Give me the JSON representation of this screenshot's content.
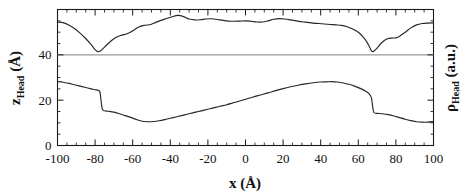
{
  "chart_data": {
    "type": "line",
    "title": "",
    "subtitle": "",
    "xlabel": "x (Å)",
    "ylabel": "z",
    "ylabel_sub": "Head",
    "ylabel_unit": " (Å)",
    "y2label": "ρ",
    "y2label_sub": "Head",
    "y2label_unit": " (a.u.)",
    "xlim": [
      -100,
      100
    ],
    "ylim": [
      0,
      60
    ],
    "xticks": [
      -100,
      -80,
      -60,
      -40,
      -20,
      0,
      20,
      40,
      60,
      80,
      100
    ],
    "xticklabels": [
      "-100",
      "-80",
      "-60",
      "-40",
      "-20",
      "0",
      "20",
      "40",
      "60",
      "80",
      "100"
    ],
    "yticks": [
      0,
      20,
      40
    ],
    "yticklabels": [
      "0",
      "20",
      "40"
    ],
    "xtick_minor_step": 5,
    "ytick_minor_step": 5,
    "grid": false,
    "legend": null,
    "reference_line": {
      "orientation": "horizontal",
      "value": 40,
      "color": "#9a9a9a",
      "label": ""
    },
    "series": [
      {
        "name": "rho_Head",
        "axis": "right",
        "color": "#262626",
        "x": [
          -100,
          -97,
          -94,
          -91,
          -88,
          -85,
          -82,
          -80,
          -78.5,
          -77,
          -75,
          -72,
          -69,
          -66,
          -63,
          -60,
          -57,
          -54,
          -51,
          -48,
          -45,
          -42,
          -39,
          -36,
          -34,
          -32,
          -30,
          -27,
          -24,
          -21,
          -18,
          -15,
          -12,
          -9,
          -6,
          -3,
          0,
          3,
          6,
          9,
          12,
          15,
          18,
          21,
          24,
          27,
          30,
          33,
          36,
          39,
          42,
          45,
          48,
          51,
          54,
          57,
          60,
          62,
          64,
          66,
          67,
          68,
          70,
          72,
          74,
          76,
          78,
          80,
          82,
          85,
          88,
          91,
          94,
          97,
          100
        ],
        "values": [
          54.5,
          54.2,
          53.2,
          51.6,
          49.6,
          47.2,
          44.4,
          42.3,
          41.4,
          41.8,
          43.4,
          45.8,
          47.6,
          48.6,
          49.3,
          50.6,
          52.2,
          53.0,
          53.3,
          54.2,
          55.2,
          56.0,
          56.8,
          57.4,
          57.2,
          56.5,
          55.8,
          55.4,
          55.5,
          55.8,
          55.9,
          55.6,
          55.2,
          54.9,
          54.8,
          54.9,
          55.0,
          54.8,
          54.5,
          54.5,
          55.0,
          55.7,
          56.0,
          55.8,
          55.4,
          55.0,
          54.6,
          54.3,
          54.0,
          53.8,
          53.6,
          53.4,
          53.2,
          53.0,
          52.4,
          51.4,
          50.0,
          48.4,
          46.4,
          43.5,
          41.7,
          41.5,
          43.0,
          45.0,
          46.4,
          47.2,
          47.4,
          47.5,
          48.2,
          50.0,
          51.9,
          53.2,
          53.8,
          54.0,
          54.1
        ]
      },
      {
        "name": "z_Head",
        "axis": "left",
        "color": "#262626",
        "x": [
          -100,
          -97,
          -94,
          -91,
          -88,
          -85,
          -82,
          -80,
          -78.5,
          -77.5,
          -77,
          -76.5,
          -76,
          -75,
          -73,
          -70,
          -67,
          -64,
          -61,
          -58,
          -55,
          -52,
          -49,
          -46,
          -43,
          -40,
          -37,
          -34,
          -31,
          -28,
          -25,
          -22,
          -19,
          -16,
          -13,
          -10,
          -7,
          -4,
          0,
          4,
          8,
          12,
          16,
          20,
          24,
          28,
          32,
          36,
          40,
          43,
          46,
          49,
          52,
          55,
          58,
          61,
          64,
          66,
          67,
          67.5,
          68,
          68.5,
          70,
          73,
          76,
          79,
          82,
          85,
          88,
          91,
          94,
          97,
          100
        ],
        "values": [
          28.2,
          27.9,
          27.4,
          26.8,
          26.2,
          25.6,
          25.0,
          24.6,
          24.4,
          23.8,
          21.0,
          17.6,
          15.8,
          15.3,
          15.1,
          14.7,
          14.0,
          13.2,
          12.4,
          11.5,
          10.7,
          10.5,
          10.6,
          10.9,
          11.4,
          12.0,
          12.6,
          13.2,
          13.8,
          14.4,
          15.0,
          15.6,
          16.2,
          16.8,
          17.4,
          18.0,
          18.7,
          19.4,
          20.4,
          21.4,
          22.3,
          23.2,
          24.2,
          25.1,
          25.9,
          26.6,
          27.2,
          27.7,
          28.0,
          28.1,
          28.2,
          28.0,
          27.6,
          27.0,
          26.2,
          25.2,
          23.9,
          22.6,
          21.0,
          18.0,
          15.4,
          14.4,
          14.2,
          14.0,
          13.6,
          13.0,
          12.3,
          11.6,
          11.0,
          10.5,
          10.3,
          10.3,
          10.6
        ]
      }
    ]
  }
}
